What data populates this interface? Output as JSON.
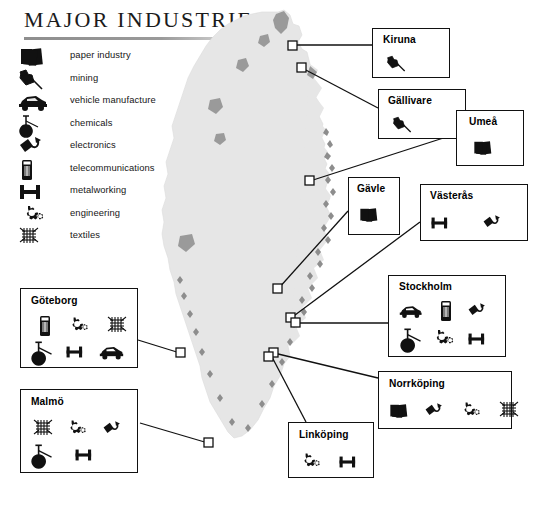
{
  "title": "MAJOR INDUSTRIES",
  "legend": {
    "items": [
      {
        "icon": "paper-industry-icon",
        "label": "paper industry"
      },
      {
        "icon": "mining-icon",
        "label": "mining"
      },
      {
        "icon": "vehicle-manufacture-icon",
        "label": "vehicle manufacture"
      },
      {
        "icon": "chemicals-icon",
        "label": "chemicals"
      },
      {
        "icon": "electronics-icon",
        "label": "electronics"
      },
      {
        "icon": "telecommunications-icon",
        "label": "telecommunications"
      },
      {
        "icon": "metalworking-icon",
        "label": "metalworking"
      },
      {
        "icon": "engineering-icon",
        "label": "engineering"
      },
      {
        "icon": "textiles-icon",
        "label": "textiles"
      }
    ]
  },
  "colors": {
    "map_fill": "#e6e6e6",
    "map_shade": "#9a9a9a",
    "ink": "#111111",
    "rule": "#8e8e8e"
  },
  "cities": [
    {
      "name": "Kiruna",
      "industries": [
        "mining"
      ]
    },
    {
      "name": "Gällivare",
      "industries": [
        "mining"
      ]
    },
    {
      "name": "Umeå",
      "industries": [
        "paper industry"
      ]
    },
    {
      "name": "Gävle",
      "industries": [
        "paper industry"
      ]
    },
    {
      "name": "Västerås",
      "industries": [
        "metalworking",
        "electronics"
      ]
    },
    {
      "name": "Stockholm",
      "industries": [
        "vehicle manufacture",
        "telecommunications",
        "electronics",
        "chemicals",
        "engineering",
        "metalworking"
      ]
    },
    {
      "name": "Norrköping",
      "industries": [
        "paper industry",
        "electronics",
        "engineering",
        "textiles"
      ]
    },
    {
      "name": "Linköping",
      "industries": [
        "engineering",
        "metalworking"
      ]
    },
    {
      "name": "Göteborg",
      "industries": [
        "telecommunications",
        "engineering",
        "textiles",
        "chemicals",
        "metalworking",
        "vehicle manufacture"
      ]
    },
    {
      "name": "Malmö",
      "industries": [
        "textiles",
        "engineering",
        "electronics",
        "chemicals",
        "metalworking"
      ]
    }
  ]
}
